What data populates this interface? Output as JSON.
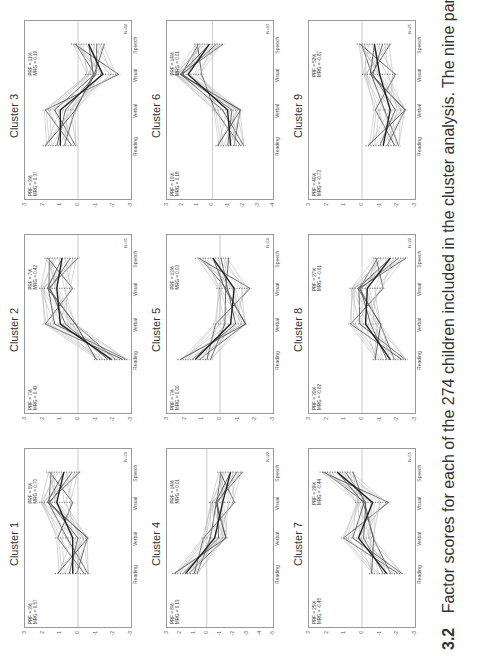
{
  "caption": {
    "figure_number": "3.2",
    "text": "Factor scores for each of the 274 children included in the cluster analysis. The nine panels represent nine"
  },
  "chart_data": [
    {
      "type": "line",
      "title": "Cluster 1",
      "categories": [
        "Reading",
        "Verbal",
        "Visual",
        "Speech"
      ],
      "ylim": [
        -3,
        3
      ],
      "yticks": [
        "3",
        "2",
        "1",
        "0",
        "-1",
        "-2",
        "-3"
      ],
      "stat_left": [
        "PRF = 3%",
        "MRG = 0.57"
      ],
      "stat_right": [
        "PRF = 0%",
        "MRG = 0.70"
      ],
      "n": "N=70",
      "mean_profile": [
        0.3,
        0.3,
        1.2,
        0.8
      ]
    },
    {
      "type": "line",
      "title": "Cluster 2",
      "categories": [
        "Reading",
        "Verbal",
        "Visual",
        "Speech"
      ],
      "ylim": [
        -3,
        3
      ],
      "yticks": [
        "3",
        "2",
        "1",
        "0",
        "-1",
        "-2",
        "-3"
      ],
      "stat_left": [
        "PRF = 7%",
        "MRG = 0.43"
      ],
      "stat_right": [
        "PRF = 7%",
        "MRG = 0.42"
      ],
      "n": "N=35",
      "mean_profile": [
        -1.9,
        1.0,
        1.2,
        0.9
      ]
    },
    {
      "type": "line",
      "title": "Cluster 3",
      "categories": [
        "Reading",
        "Verbal",
        "Visual",
        "Speech"
      ],
      "ylim": [
        -3,
        3
      ],
      "yticks": [
        "3",
        "2",
        "1",
        "0",
        "-1",
        "-2",
        "-3"
      ],
      "stat_left": [
        "PRF = 9%",
        "MRG = 0.37"
      ],
      "stat_right": [
        "PRF = 11%",
        "MRG = 0.19"
      ],
      "n": "N=44",
      "mean_profile": [
        1.0,
        1.0,
        -1.4,
        -0.6
      ]
    },
    {
      "type": "line",
      "title": "Cluster 4",
      "categories": [
        "Reading",
        "Verbal",
        "Visual",
        "Speech"
      ],
      "ylim": [
        -5,
        3
      ],
      "yticks": [
        "3",
        "2",
        "1",
        "0",
        "-1",
        "-2",
        "-3",
        "-4",
        "-5"
      ],
      "stat_left": [
        "PRF = 8%",
        "MRG = 0.13"
      ],
      "stat_right": [
        "PRF = 14%",
        "MRG = 0.01"
      ],
      "n": "N=22",
      "mean_profile": [
        1.6,
        -0.6,
        -1.2,
        -1.8
      ]
    },
    {
      "type": "line",
      "title": "Cluster 5",
      "categories": [
        "Reading",
        "Verbal",
        "Visual",
        "Speech"
      ],
      "ylim": [
        -3,
        3
      ],
      "yticks": [
        "3",
        "2",
        "1",
        "0",
        "-1",
        "-2",
        "-3"
      ],
      "stat_left": [
        "PRF = 7%",
        "MRG = 0.00"
      ],
      "stat_right": [
        "PRF = 13%",
        "MRG = 0.03"
      ],
      "n": "N=54",
      "mean_profile": [
        1.4,
        -0.6,
        -0.8,
        0.4
      ]
    },
    {
      "type": "line",
      "title": "Cluster 6",
      "categories": [
        "Reading",
        "Verbal",
        "Visual",
        "Speech"
      ],
      "ylim": [
        -4,
        3
      ],
      "yticks": [
        "3",
        "2",
        "1",
        "0",
        "-1",
        "-2",
        "-3",
        "-4"
      ],
      "stat_left": [
        "PRF = 10%",
        "MRG = 0.18"
      ],
      "stat_right": [
        "PRF = 14%",
        "MRG = 0.01"
      ],
      "n": "N=43",
      "mean_profile": [
        -1.2,
        -1.0,
        1.6,
        0.2
      ]
    },
    {
      "type": "line",
      "title": "Cluster 7",
      "categories": [
        "Reading",
        "Verbal",
        "Visual",
        "Speech"
      ],
      "ylim": [
        -3,
        3
      ],
      "yticks": [
        "3",
        "2",
        "1",
        "0",
        "-1",
        "-2",
        "-3"
      ],
      "stat_left": [
        "PRF = 25%",
        "MRG = -0.45"
      ],
      "stat_right": [
        "PRF = 29%",
        "MRG = -0.44"
      ],
      "n": "N=55",
      "mean_profile": [
        -1.4,
        0.2,
        -0.6,
        1.4
      ]
    },
    {
      "type": "line",
      "title": "Cluster 8",
      "categories": [
        "Reading",
        "Verbal",
        "Visual",
        "Speech"
      ],
      "ylim": [
        -3,
        3
      ],
      "yticks": [
        "3",
        "2",
        "1",
        "0",
        "-1",
        "-2",
        "-3"
      ],
      "stat_left": [
        "PRF = 30%",
        "MRG = -0.62"
      ],
      "stat_right": [
        "PRF = 27%",
        "MRG = -0.61"
      ],
      "n": "N=22",
      "mean_profile": [
        -1.6,
        -0.2,
        -0.3,
        -1.6
      ]
    },
    {
      "type": "line",
      "title": "Cluster 9",
      "categories": [
        "Reading",
        "Verbal",
        "Visual",
        "Speech"
      ],
      "ylim": [
        -3,
        3
      ],
      "yticks": [
        "3",
        "2",
        "1",
        "0",
        "-1",
        "-2",
        "-3"
      ],
      "stat_left": [
        "PRF = 40%",
        "MRG = -0.73"
      ],
      "stat_right": [
        "PRF = 52%",
        "MRG = -0.87"
      ],
      "n": "N=25",
      "mean_profile": [
        -1.2,
        -1.6,
        -1.0,
        -0.7
      ]
    }
  ]
}
